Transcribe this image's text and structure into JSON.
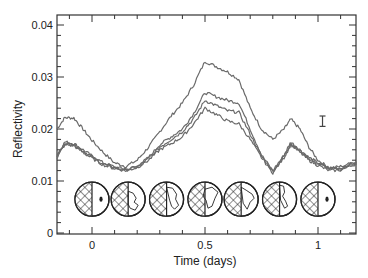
{
  "chart_data": {
    "type": "line",
    "title": "",
    "xlabel": "Time (days)",
    "ylabel": "Reflectivity",
    "xlim": [
      -0.155,
      1.17
    ],
    "ylim": [
      0,
      0.042
    ],
    "xticks": [
      0,
      0.5,
      1
    ],
    "xtick_labels": [
      "0",
      "0.5",
      "1"
    ],
    "yticks": [
      0,
      0.01,
      0.02,
      0.03,
      0.04
    ],
    "ytick_labels": [
      "0",
      "0.01",
      "0.02",
      "0.03",
      "0.04"
    ],
    "grid": false,
    "legend": null,
    "x": [
      -0.155,
      -0.12,
      -0.08,
      -0.04,
      0.0,
      0.05,
      0.1,
      0.15,
      0.2,
      0.25,
      0.3,
      0.35,
      0.4,
      0.45,
      0.5,
      0.55,
      0.6,
      0.65,
      0.7,
      0.75,
      0.8,
      0.85,
      0.88,
      0.92,
      0.96,
      1.0,
      1.05,
      1.1,
      1.17
    ],
    "series": [
      {
        "name": "curve-1",
        "values": [
          0.02,
          0.0222,
          0.0221,
          0.02,
          0.0178,
          0.0155,
          0.0135,
          0.0128,
          0.014,
          0.0165,
          0.0195,
          0.0225,
          0.025,
          0.0285,
          0.033,
          0.032,
          0.031,
          0.0295,
          0.024,
          0.02,
          0.018,
          0.02,
          0.0219,
          0.02,
          0.0165,
          0.014,
          0.0125,
          0.0128,
          0.0137
        ]
      },
      {
        "name": "curve-2",
        "values": [
          0.015,
          0.0175,
          0.0172,
          0.016,
          0.0148,
          0.0135,
          0.0127,
          0.0122,
          0.0128,
          0.0145,
          0.017,
          0.0185,
          0.02,
          0.023,
          0.027,
          0.0262,
          0.0255,
          0.025,
          0.02,
          0.015,
          0.012,
          0.015,
          0.0175,
          0.016,
          0.0145,
          0.0135,
          0.0125,
          0.0125,
          0.0137
        ]
      },
      {
        "name": "curve-3",
        "values": [
          0.0148,
          0.0172,
          0.017,
          0.0158,
          0.0146,
          0.0133,
          0.0126,
          0.0121,
          0.0127,
          0.0143,
          0.0165,
          0.018,
          0.0195,
          0.022,
          0.0255,
          0.0245,
          0.0235,
          0.0232,
          0.019,
          0.0148,
          0.0118,
          0.0148,
          0.0172,
          0.0158,
          0.0143,
          0.0133,
          0.0123,
          0.0123,
          0.0135
        ]
      },
      {
        "name": "curve-4",
        "values": [
          0.0145,
          0.017,
          0.0168,
          0.0155,
          0.0144,
          0.0131,
          0.0124,
          0.012,
          0.0126,
          0.014,
          0.016,
          0.0172,
          0.0185,
          0.021,
          0.024,
          0.0228,
          0.0215,
          0.021,
          0.018,
          0.0145,
          0.0116,
          0.0145,
          0.017,
          0.0155,
          0.014,
          0.013,
          0.012,
          0.0121,
          0.0133
        ]
      }
    ],
    "annotations": [
      {
        "type": "error-bar",
        "x": 1.02,
        "y_center": 0.0215,
        "half_height": 0.001
      },
      {
        "type": "earth-phase-icons",
        "count": 7,
        "y": 0.0065,
        "x": [
          0.0,
          0.16,
          0.33,
          0.5,
          0.66,
          0.83,
          1.0
        ]
      }
    ]
  },
  "axes": {
    "xlabel": "Time (days)",
    "ylabel": "Reflectivity"
  },
  "globes": [
    {
      "phase": "half-lit",
      "land": "dot"
    },
    {
      "phase": "half-lit",
      "land": "asia"
    },
    {
      "phase": "half-lit",
      "land": "africa-europe"
    },
    {
      "phase": "half-lit",
      "land": "africa"
    },
    {
      "phase": "half-lit",
      "land": "south-america"
    },
    {
      "phase": "half-lit",
      "land": "americas"
    },
    {
      "phase": "half-lit",
      "land": "dot"
    }
  ],
  "colors": {
    "line": "#6a6a6a",
    "axis": "#333333",
    "globe": "#222222"
  }
}
